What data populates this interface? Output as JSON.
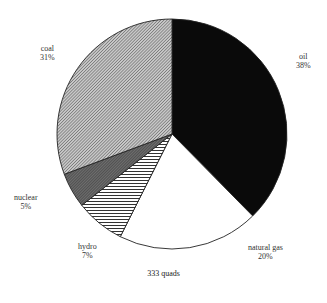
{
  "chart_data": {
    "type": "pie",
    "title": "",
    "total_label": "333 quads",
    "start_angle_deg": 0,
    "direction": "clockwise",
    "slices": [
      {
        "label": "oil",
        "percent": 38,
        "pct_text": "38%",
        "fill": "solid-black",
        "color": "#0a0a0a"
      },
      {
        "label": "natural gas",
        "percent": 20,
        "pct_text": "20%",
        "fill": "white",
        "color": "#ffffff"
      },
      {
        "label": "hydro",
        "percent": 7,
        "pct_text": "7%",
        "fill": "horizontal-lines",
        "color": "#555555"
      },
      {
        "label": "nuclear",
        "percent": 5,
        "pct_text": "5%",
        "fill": "dark-gray-stipple",
        "color": "#5a5a5a"
      },
      {
        "label": "coal",
        "percent": 31,
        "pct_text": "31%",
        "fill": "fine-diagonal-hatch",
        "color": "#9a9a9a"
      }
    ],
    "geometry": {
      "cx": 172,
      "cy": 134,
      "r": 115
    }
  },
  "labels": {
    "oil": {
      "name": "oil",
      "pct": "38%"
    },
    "natural_gas": {
      "name": "natural gas",
      "pct": "20%"
    },
    "hydro": {
      "name": "hydro",
      "pct": "7%"
    },
    "nuclear": {
      "name": "nuclear",
      "pct": "5%"
    },
    "coal": {
      "name": "coal",
      "pct": "31%"
    }
  },
  "footer": {
    "total": "333 quads"
  }
}
